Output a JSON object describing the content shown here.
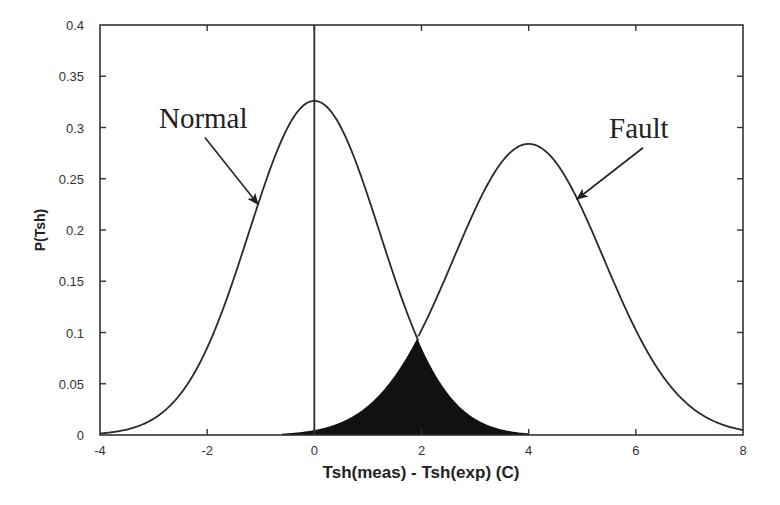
{
  "chart_data": {
    "type": "line",
    "title": "",
    "xlabel": "Tsh(meas) - Tsh(exp) (C)",
    "ylabel": "P(Tsh)",
    "xlim": [
      -4,
      8
    ],
    "ylim": [
      0,
      0.4
    ],
    "grid": false,
    "legend": null,
    "xticks": [
      -4,
      -2,
      0,
      2,
      4,
      6,
      8
    ],
    "xtick_labels": [
      "-4",
      "-2",
      "0",
      "2",
      "4",
      "6",
      "8"
    ],
    "yticks": [
      0,
      0.05,
      0.1,
      0.15,
      0.2,
      0.25,
      0.3,
      0.35,
      0.4
    ],
    "ytick_labels": [
      "0",
      "0.05",
      "0.1",
      "0.15",
      "0.2",
      "0.25",
      "0.3",
      "0.35",
      "0.4"
    ],
    "series": [
      {
        "name": "Normal",
        "distribution": "gaussian",
        "mean": 0,
        "std": 1.22,
        "peak": 0.326,
        "x": [
          -4,
          -3,
          -2,
          -1,
          0,
          1,
          1.94
        ],
        "values": [
          0.0015,
          0.016,
          0.085,
          0.232,
          0.326,
          0.232,
          0.091
        ]
      },
      {
        "name": "Fault",
        "distribution": "gaussian",
        "mean": 4,
        "std": 1.4,
        "peak": 0.284,
        "x": [
          1.94,
          3,
          4,
          5,
          6,
          7,
          8
        ],
        "values": [
          0.091,
          0.22,
          0.284,
          0.22,
          0.103,
          0.029,
          0.005
        ]
      }
    ],
    "shaded_region": {
      "description": "overlap area under min(Normal, Fault)",
      "x_range": [
        -0.6,
        4.0
      ],
      "peak_x": 1.94,
      "peak_y": 0.091,
      "color": "#111111"
    },
    "vertical_line": {
      "x": 0
    },
    "annotations": [
      {
        "text": "Normal",
        "text_xy": [
          -2.9,
          0.3
        ],
        "arrow_to": [
          -1.05,
          0.225
        ]
      },
      {
        "text": "Fault",
        "text_xy": [
          5.5,
          0.29
        ],
        "arrow_to": [
          4.9,
          0.23
        ]
      }
    ]
  }
}
